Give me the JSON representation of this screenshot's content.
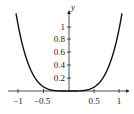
{
  "chart_data": {
    "type": "line",
    "title": "",
    "xlabel": "",
    "ylabel": "y",
    "function": "y = x^4",
    "xlim": [
      -1.05,
      1.1
    ],
    "ylim": [
      0,
      1.25
    ],
    "grid": false,
    "legend": null,
    "x_ticks": [
      -1,
      -0.5,
      0.5,
      1
    ],
    "x_tick_labels": [
      "−1",
      "−0.5",
      "0.5",
      "1"
    ],
    "y_ticks": [
      0.2,
      0.4,
      0.6,
      0.8,
      1
    ],
    "y_tick_labels": [
      "0.2",
      "0.4",
      "0.6",
      "0.8",
      "1"
    ],
    "series": [
      {
        "name": "y = x^4",
        "x": [
          -1.05,
          -1.0,
          -0.9,
          -0.8,
          -0.7,
          -0.6,
          -0.5,
          -0.4,
          -0.3,
          -0.2,
          -0.1,
          0,
          0.1,
          0.2,
          0.3,
          0.4,
          0.5,
          0.6,
          0.7,
          0.8,
          0.9,
          1.0,
          1.05
        ],
        "values": [
          1.216,
          1.0,
          0.656,
          0.41,
          0.24,
          0.13,
          0.0625,
          0.0256,
          0.0081,
          0.0016,
          0.0001,
          0,
          0.0001,
          0.0016,
          0.0081,
          0.0256,
          0.0625,
          0.13,
          0.24,
          0.41,
          0.656,
          1.0,
          1.216
        ]
      }
    ]
  },
  "labels": {
    "y_axis": "y",
    "x_ticks": [
      "−1",
      "−0.5",
      "0.5",
      "1"
    ],
    "y_ticks": [
      "0.2",
      "0.4",
      "0.6",
      "0.8",
      "1"
    ]
  }
}
